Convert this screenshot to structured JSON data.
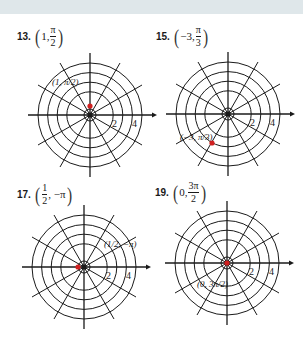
{
  "colors": {
    "band": "#dfe7ea",
    "grid": "#1a1a1a",
    "point": "#d02020"
  },
  "problems": [
    {
      "number": "13.",
      "r_text": "1,",
      "theta_num": "π",
      "theta_den": "2",
      "theta_prefix": "",
      "point_label": "(1, π/2)",
      "tick_labels": [
        "2",
        "4"
      ]
    },
    {
      "number": "15.",
      "r_text": "−3,",
      "theta_num": "π",
      "theta_den": "3",
      "theta_prefix": "",
      "point_label": "(−3, π/3)",
      "tick_labels": [
        "2",
        "4"
      ]
    },
    {
      "number": "17.",
      "r_num": "1",
      "r_den": "2",
      "theta_text": "−π",
      "point_label": "(1/2, −π)",
      "tick_labels": [
        "2",
        "4"
      ]
    },
    {
      "number": "19.",
      "r_text": "0,",
      "theta_num": "3π",
      "theta_den": "2",
      "point_label": "(0, 3π/2)",
      "tick_labels": [
        "2",
        "4"
      ]
    }
  ]
}
